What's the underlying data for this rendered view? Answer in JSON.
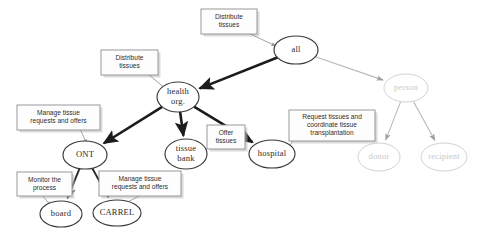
{
  "diagram": {
    "type": "goal-decomposition-graph",
    "background_color": "#ffffff",
    "nodes": [
      {
        "id": "all",
        "label": "all",
        "cx": 296,
        "cy": 50,
        "rx": 22,
        "ry": 14,
        "style": "normal"
      },
      {
        "id": "health_org",
        "label_line1": "health",
        "label_line2": "org.",
        "cx": 178,
        "cy": 97,
        "rx": 21,
        "ry": 15,
        "style": "normal"
      },
      {
        "id": "ont",
        "label": "ONT",
        "cx": 85,
        "cy": 155,
        "rx": 22,
        "ry": 14,
        "style": "normal"
      },
      {
        "id": "tissue_bank",
        "label_line1": "tissue",
        "label_line2": "bank",
        "cx": 186,
        "cy": 154,
        "rx": 21,
        "ry": 15,
        "style": "normal"
      },
      {
        "id": "hospital",
        "label": "hospital",
        "cx": 272,
        "cy": 154,
        "rx": 23,
        "ry": 14,
        "style": "normal"
      },
      {
        "id": "board",
        "label": "board",
        "cx": 61,
        "cy": 214,
        "rx": 21,
        "ry": 13,
        "style": "normal"
      },
      {
        "id": "carrel",
        "label": "CARREL",
        "cx": 117,
        "cy": 213,
        "rx": 24,
        "ry": 13,
        "style": "normal"
      },
      {
        "id": "person",
        "label": "person",
        "cx": 406,
        "cy": 88,
        "rx": 22,
        "ry": 14,
        "style": "faded"
      },
      {
        "id": "donor",
        "label": "donor",
        "cx": 379,
        "cy": 157,
        "rx": 21,
        "ry": 14,
        "style": "faded"
      },
      {
        "id": "recipient",
        "label": "recipient",
        "cx": 444,
        "cy": 157,
        "rx": 23,
        "ry": 14,
        "style": "faded"
      }
    ],
    "edges": [
      {
        "from": "all",
        "to": "health_org",
        "weight": "strong"
      },
      {
        "from": "all",
        "to": "person",
        "weight": "faded"
      },
      {
        "from": "health_org",
        "to": "ont",
        "weight": "strong"
      },
      {
        "from": "health_org",
        "to": "tissue_bank",
        "weight": "strong"
      },
      {
        "from": "health_org",
        "to": "hospital",
        "weight": "strong"
      },
      {
        "from": "ont",
        "to": "board",
        "weight": "mid"
      },
      {
        "from": "ont",
        "to": "carrel",
        "weight": "mid"
      },
      {
        "from": "person",
        "to": "donor",
        "weight": "faded"
      },
      {
        "from": "person",
        "to": "recipient",
        "weight": "faded"
      }
    ],
    "callouts": [
      {
        "id": "callout-all",
        "lines": [
          "Distribute",
          "tissues"
        ],
        "x": 201,
        "y": 9,
        "w": 56,
        "h": 25,
        "target_x": 276,
        "target_y": 46,
        "tail_from_x": 248,
        "tail_from_y": 33
      },
      {
        "id": "callout-health-org",
        "lines": [
          "Distribute",
          "tissues"
        ],
        "x": 101,
        "y": 50,
        "w": 57,
        "h": 25,
        "target_x": 167,
        "target_y": 90,
        "tail_from_x": 148,
        "tail_from_y": 74
      },
      {
        "id": "callout-ont",
        "lines": [
          "Manage tissue",
          "requests and offers"
        ],
        "x": 17,
        "y": 105,
        "w": 83,
        "h": 25,
        "target_x": 87,
        "target_y": 144,
        "tail_from_x": 80,
        "tail_from_y": 129
      },
      {
        "id": "callout-tissue-bank",
        "lines": [
          "Offer",
          "tissues"
        ],
        "x": 207,
        "y": 125,
        "w": 38,
        "h": 24,
        "target_x": 201,
        "target_y": 155,
        "tail_from_x": 209,
        "tail_from_y": 147
      },
      {
        "id": "callout-hospital",
        "lines": [
          "Request tissues and",
          "coordinate tissue",
          "transplantation"
        ],
        "x": 289,
        "y": 110,
        "w": 86,
        "h": 31,
        "target_x": 285,
        "target_y": 154,
        "tail_from_x": 293,
        "tail_from_y": 140
      },
      {
        "id": "callout-board",
        "lines": [
          "Monitor the",
          "process"
        ],
        "x": 17,
        "y": 172,
        "w": 55,
        "h": 24,
        "target_x": 51,
        "target_y": 206,
        "tail_from_x": 42,
        "tail_from_y": 195
      },
      {
        "id": "callout-carrel",
        "lines": [
          "Manage tissue",
          "requests and offers"
        ],
        "x": 99,
        "y": 171,
        "w": 82,
        "h": 25,
        "target_x": 122,
        "target_y": 205,
        "tail_from_x": 141,
        "tail_from_y": 195
      }
    ]
  }
}
